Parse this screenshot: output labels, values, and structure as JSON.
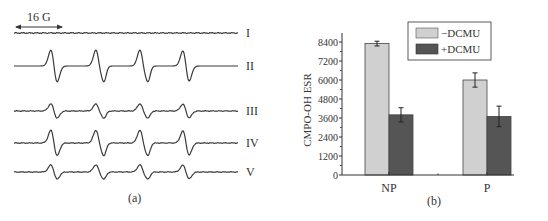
{
  "chart_data": [
    {
      "type": "line",
      "panel_label": "(a)",
      "title": "",
      "xlabel": "",
      "ylabel": "",
      "scale_bar_label": "16 G",
      "description": "ESR spectra of DMPO-OH adduct (4-line 1:2:2:1 pattern), stacked traces",
      "series": [
        {
          "name": "I",
          "relative_amplitude": 0.05
        },
        {
          "name": "II",
          "relative_amplitude": 1.0
        },
        {
          "name": "III",
          "relative_amplitude": 0.45
        },
        {
          "name": "IV",
          "relative_amplitude": 0.8
        },
        {
          "name": "V",
          "relative_amplitude": 0.45
        }
      ]
    },
    {
      "type": "bar",
      "panel_label": "(b)",
      "title": "",
      "xlabel": "",
      "ylabel": "CMPO-OH ESR",
      "categories": [
        "NP",
        "P"
      ],
      "series": [
        {
          "name": "−DCMU",
          "color": "#d0d0d0",
          "values": [
            8300,
            6000
          ],
          "errors": [
            150,
            450
          ]
        },
        {
          "name": "+DCMU",
          "color": "#555555",
          "values": [
            3800,
            3700
          ],
          "errors": [
            450,
            650
          ]
        }
      ],
      "ylim": [
        0,
        8400
      ],
      "yticks": [
        0,
        1200,
        2400,
        3600,
        4800,
        6000,
        7200,
        8400
      ],
      "legend_position": "top-right",
      "grid": false
    }
  ]
}
